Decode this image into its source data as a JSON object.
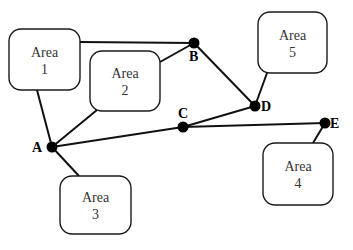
{
  "diagram": {
    "type": "network-graph",
    "nodes": [
      {
        "id": "A",
        "label": "A"
      },
      {
        "id": "B",
        "label": "B"
      },
      {
        "id": "C",
        "label": "C"
      },
      {
        "id": "D",
        "label": "D"
      },
      {
        "id": "E",
        "label": "E"
      }
    ],
    "areas": [
      {
        "id": "area1",
        "line1": "Area",
        "line2": "1"
      },
      {
        "id": "area2",
        "line1": "Area",
        "line2": "2"
      },
      {
        "id": "area3",
        "line1": "Area",
        "line2": "3"
      },
      {
        "id": "area4",
        "line1": "Area",
        "line2": "4"
      },
      {
        "id": "area5",
        "line1": "Area",
        "line2": "5"
      }
    ],
    "edges": [
      {
        "from": "area1",
        "to": "B"
      },
      {
        "from": "area1",
        "to": "A"
      },
      {
        "from": "area2",
        "to": "B"
      },
      {
        "from": "area2",
        "to": "A"
      },
      {
        "from": "A",
        "to": "C"
      },
      {
        "from": "A",
        "to": "area3"
      },
      {
        "from": "C",
        "to": "D"
      },
      {
        "from": "C",
        "to": "E"
      },
      {
        "from": "B",
        "to": "D"
      },
      {
        "from": "D",
        "to": "area5"
      },
      {
        "from": "E",
        "to": "area4"
      }
    ],
    "colors": {
      "line": "#111111",
      "node": "#000000",
      "box_border": "#1a1a1a"
    }
  }
}
